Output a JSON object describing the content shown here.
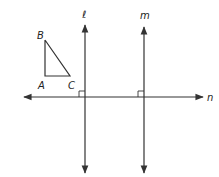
{
  "diagram": {
    "triangle": {
      "vertices": {
        "A": {
          "label": "A"
        },
        "B": {
          "label": "B"
        },
        "C": {
          "label": "C"
        }
      }
    },
    "lines": {
      "l": {
        "label": "ℓ",
        "orientation": "vertical"
      },
      "m": {
        "label": "m",
        "orientation": "vertical"
      },
      "n": {
        "label": "n",
        "orientation": "horizontal"
      }
    },
    "right_angle_marks": [
      "ℓ ⊥ n",
      "m ⊥ n"
    ],
    "colors": {
      "stroke": "#333333",
      "background": "#ffffff"
    }
  }
}
